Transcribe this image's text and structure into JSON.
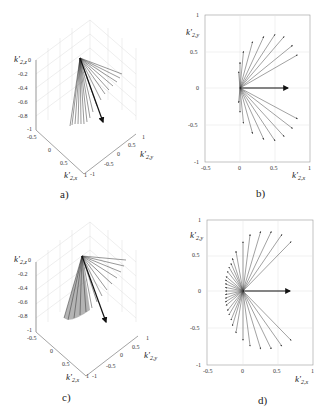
{
  "chart_data": [
    {
      "panel": "a",
      "type": "line3d",
      "caption": "a)",
      "xlabel": "k'_{2,x}",
      "ylabel": "k'_{2,y}",
      "zlabel": "k'_{2,z}",
      "xticks": [
        "-0.5",
        "0",
        "0.5",
        "1"
      ],
      "yticks": [
        "-1",
        "-0.5",
        "0",
        "0.5",
        "1"
      ],
      "zticks": [
        "0",
        "-0.2",
        "-0.4",
        "-0.6",
        "-0.8",
        "-1"
      ],
      "xlim": [
        -0.5,
        1
      ],
      "ylim": [
        -1,
        1
      ],
      "zlim": [
        -1,
        0
      ],
      "grid": true,
      "description": "Fan of unit vectors from origin; highlighted thick vector pointing toward x≈0.7, z≈-0.7"
    },
    {
      "panel": "b",
      "type": "quiver",
      "caption": "b)",
      "xlabel": "k'_{2,x}",
      "ylabel": "k'_{2,y}",
      "xticks": [
        "-0.5",
        "0",
        "0.5",
        "1"
      ],
      "yticks": [
        "1",
        "0.5",
        "0",
        "-0.5",
        "-1"
      ],
      "xlim": [
        -0.5,
        1
      ],
      "ylim": [
        -1,
        1
      ],
      "grid": true,
      "highlight_vector": [
        0.68,
        0
      ],
      "vectors": [
        [
          -0.02,
          0.22
        ],
        [
          0,
          0.35
        ],
        [
          0.05,
          0.5
        ],
        [
          0.18,
          0.63
        ],
        [
          0.34,
          0.7
        ],
        [
          0.5,
          0.73
        ],
        [
          0.63,
          0.7
        ],
        [
          0.75,
          0.58
        ],
        [
          0.82,
          0.45
        ],
        [
          0.82,
          -0.42
        ],
        [
          0.75,
          -0.55
        ],
        [
          0.63,
          -0.66
        ],
        [
          0.5,
          -0.72
        ],
        [
          0.34,
          -0.7
        ],
        [
          0.18,
          -0.62
        ],
        [
          0.05,
          -0.48
        ],
        [
          0,
          -0.33
        ],
        [
          -0.02,
          -0.2
        ]
      ]
    },
    {
      "panel": "c",
      "type": "line3d",
      "caption": "c)",
      "xlabel": "k'_{2,x}",
      "ylabel": "k'_{2,y}",
      "zlabel": "k'_{2,z}",
      "xticks": [
        "-0.5",
        "0",
        "0.5",
        "1"
      ],
      "yticks": [
        "-1",
        "-0.5",
        "0",
        "0.5",
        "1"
      ],
      "zticks": [
        "0",
        "-0.2",
        "-0.4",
        "-0.6",
        "-0.8",
        "-1"
      ],
      "xlim": [
        -0.5,
        1
      ],
      "ylim": [
        -1,
        1
      ],
      "zlim": [
        -1,
        0
      ],
      "grid": true
    },
    {
      "panel": "d",
      "type": "quiver",
      "caption": "d)",
      "xlabel": "k'_{2,x}",
      "ylabel": "k'_{2,y}",
      "xticks": [
        "-0.5",
        "0",
        "0.5",
        "1"
      ],
      "yticks": [
        "1",
        "0.5",
        "0",
        "-0.5",
        "-1"
      ],
      "xlim": [
        -0.5,
        1
      ],
      "ylim": [
        -1,
        1
      ],
      "grid": true,
      "highlight_vector": [
        0.68,
        0
      ],
      "vectors": [
        [
          -0.25,
          0.15
        ],
        [
          -0.24,
          0.2
        ],
        [
          -0.22,
          0.27
        ],
        [
          -0.2,
          0.33
        ],
        [
          -0.17,
          0.38
        ],
        [
          -0.15,
          0.45
        ],
        [
          -0.1,
          0.55
        ],
        [
          0,
          0.68
        ],
        [
          0.1,
          0.78
        ],
        [
          0.25,
          0.82
        ],
        [
          0.4,
          0.82
        ],
        [
          0.55,
          0.78
        ],
        [
          0.68,
          0.68
        ],
        [
          -0.25,
          -0.15
        ],
        [
          -0.24,
          -0.2
        ],
        [
          -0.22,
          -0.27
        ],
        [
          -0.2,
          -0.33
        ],
        [
          -0.17,
          -0.4
        ],
        [
          -0.15,
          -0.48
        ],
        [
          -0.1,
          -0.58
        ],
        [
          0,
          -0.68
        ],
        [
          0.1,
          -0.76
        ],
        [
          0.25,
          -0.8
        ],
        [
          0.4,
          -0.8
        ],
        [
          0.55,
          -0.76
        ],
        [
          0.68,
          -0.68
        ],
        [
          -0.25,
          0.1
        ],
        [
          -0.25,
          0.05
        ],
        [
          -0.25,
          0
        ],
        [
          -0.25,
          -0.05
        ],
        [
          -0.25,
          -0.1
        ]
      ]
    }
  ],
  "captions": {
    "a": "a)",
    "b": "b)",
    "c": "c)",
    "d": "d)"
  }
}
